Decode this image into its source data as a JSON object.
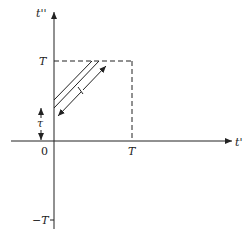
{
  "diagram": {
    "axes": {
      "vertical_label": "t''",
      "horizontal_label": "t'",
      "origin_label": "0"
    },
    "ticks": {
      "vertical_T": "T",
      "vertical_neg_T": "−T",
      "horizontal_T": "T"
    },
    "annotations": {
      "tau": "τ",
      "length_mark": "l"
    },
    "colors": {
      "stroke": "#222222",
      "background": "#ffffff"
    }
  }
}
